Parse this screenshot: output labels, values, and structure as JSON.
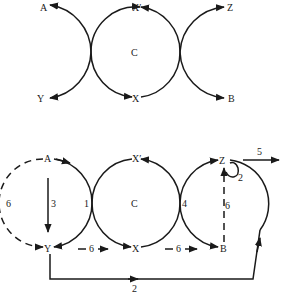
{
  "top_diagram": {
    "nodes": {
      "A": "A",
      "X_prime": "X′",
      "Z": "Z",
      "Y": "Y",
      "X": "X",
      "B": "B",
      "C": "C"
    }
  },
  "bottom_diagram": {
    "nodes": {
      "A": "A",
      "X_prime": "X′",
      "Z": "Z",
      "Y": "Y",
      "X": "X",
      "B": "B",
      "C": "C"
    },
    "labels": {
      "left_dashed": "6",
      "A_to_Y": "3",
      "left_tangent": "1",
      "right_tangent": "4",
      "B_to_Z_dashed": "6",
      "Z_loop": "2",
      "Z_exit": "5",
      "Y_to_X": "6",
      "X_to_B": "6",
      "Y_bottom_route": "2"
    }
  },
  "colors": {
    "stroke": "#1a1a1a",
    "background": "#ffffff"
  }
}
